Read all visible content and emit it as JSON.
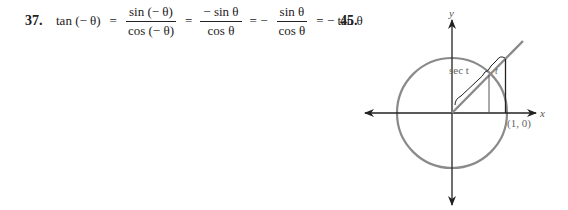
{
  "problem_37": {
    "number": "37.",
    "lhs": "tan (− θ)",
    "eq1": "=",
    "frac1": {
      "num": "sin (− θ)",
      "den": "cos (− θ)"
    },
    "eq2": "=",
    "frac2": {
      "num": "− sin θ",
      "den": "cos θ"
    },
    "eq3": "= −",
    "frac3": {
      "num": "sin θ",
      "den": "cos θ"
    },
    "result": "= − tan θ"
  },
  "problem_45": {
    "number": "45.",
    "diagram": {
      "y_label": "y",
      "x_label": "x",
      "point_label": "(1, 0)",
      "sec_label": "sec t",
      "tan_label": "t",
      "circle_color": "#8a8a8a",
      "axis_color": "#222222"
    }
  }
}
